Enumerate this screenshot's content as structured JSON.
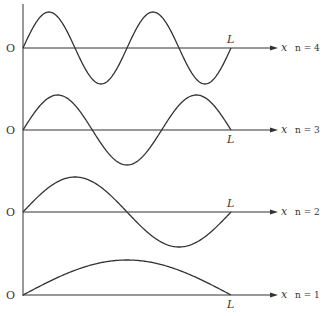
{
  "figure": {
    "origin_label": "O",
    "length_label": "L",
    "axis_label": "x",
    "modes": [
      {
        "n": 4,
        "label": "n = 4",
        "axis_y": 48,
        "amplitude": 36
      },
      {
        "n": 3,
        "label": "n = 3",
        "axis_y": 130,
        "amplitude": 35
      },
      {
        "n": 2,
        "label": "n = 2",
        "axis_y": 212,
        "amplitude": 35
      },
      {
        "n": 1,
        "label": "n = 1",
        "axis_y": 295,
        "amplitude": 35
      }
    ],
    "colors": {
      "line": "#333333",
      "text": "#333333"
    }
  }
}
